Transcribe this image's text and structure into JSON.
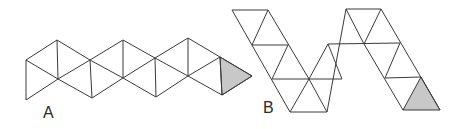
{
  "figures": [
    {
      "id": "A",
      "label": "A",
      "description": "Horizontal strip net of 10 equilateral triangles (icosahedron-style strip) with one shaded end triangle",
      "triangle_count": 10,
      "shaded_triangles": 1
    },
    {
      "id": "B",
      "label": "B",
      "description": "W/zigzag shaped net of equilateral triangles with one shaded triangle at bottom-right",
      "triangle_count": 20,
      "shaded_triangles": 1
    }
  ],
  "colors": {
    "stroke": "#3a3a3a",
    "shade": "#c8c8c8",
    "background": "#ffffff"
  }
}
